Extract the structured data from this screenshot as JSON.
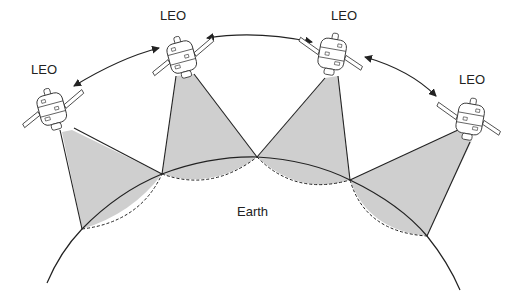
{
  "diagram": {
    "type": "satellite-constellation",
    "colors": {
      "footprint_fill": "#cfcfcf",
      "line": "#222222",
      "background": "#ffffff"
    },
    "earth_label": "Earth",
    "satellites": [
      {
        "label": "LEO"
      },
      {
        "label": "LEO"
      },
      {
        "label": "LEO"
      },
      {
        "label": "LEO"
      }
    ],
    "links": [
      {
        "from": 0,
        "to": 1,
        "style": "bidirectional-arrow"
      },
      {
        "from": 1,
        "to": 2,
        "style": "bidirectional-arrow"
      },
      {
        "from": 2,
        "to": 3,
        "style": "bidirectional-arrow"
      }
    ]
  }
}
